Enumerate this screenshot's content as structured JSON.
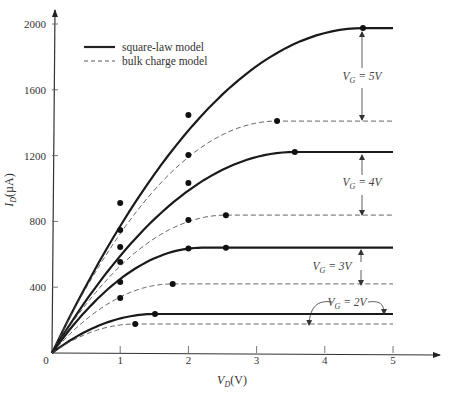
{
  "chart_data": {
    "type": "line",
    "title": "",
    "xlabel": "V_D(V)",
    "ylabel": "I_D(µA)",
    "xlim": [
      0,
      5.5
    ],
    "ylim": [
      0,
      2100
    ],
    "x_ticks": [
      "0",
      "1",
      "2",
      "3",
      "4",
      "5"
    ],
    "y_ticks": [
      "400",
      "800",
      "1200",
      "1600",
      "2000"
    ],
    "origin_label": "0",
    "grid": false,
    "legend": {
      "position": "upper-left",
      "entries": [
        {
          "label": "square-law model",
          "style": "solid"
        },
        {
          "label": "bulk charge model",
          "style": "dashed"
        }
      ]
    },
    "annotations": [
      {
        "text": "V_G = 5V",
        "sub": "G",
        "main": "V",
        "rest": " = 5V"
      },
      {
        "text": "V_G = 4V",
        "sub": "G",
        "main": "V",
        "rest": " = 4V"
      },
      {
        "text": "V_G = 3V",
        "sub": "G",
        "main": "V",
        "rest": " = 3V"
      },
      {
        "text": "V_G = 2V",
        "sub": "G",
        "main": "V",
        "rest": " = 2V"
      }
    ],
    "series": [
      {
        "name": "square-law model, V_G=5V",
        "style": "solid",
        "vdsat": 4.56,
        "isat": 1975,
        "markers": [
          [
            1,
            912
          ],
          [
            2,
            1447
          ],
          [
            4.56,
            1975
          ]
        ]
      },
      {
        "name": "bulk charge model, V_G=5V",
        "style": "dashed",
        "vdsat": 3.3,
        "isat": 1410,
        "markers": [
          [
            1,
            748
          ],
          [
            2,
            1204
          ],
          [
            3.3,
            1410
          ]
        ]
      },
      {
        "name": "square-law model, V_G=4V",
        "style": "solid",
        "vdsat": 3.56,
        "isat": 1222,
        "markers": [
          [
            1,
            645
          ],
          [
            2,
            1034
          ],
          [
            3.56,
            1222
          ]
        ]
      },
      {
        "name": "bulk charge model, V_G=4V",
        "style": "dashed",
        "vdsat": 2.55,
        "isat": 838,
        "markers": [
          [
            1,
            553
          ],
          [
            2,
            808
          ],
          [
            2.55,
            838
          ]
        ]
      },
      {
        "name": "square-law model, V_G=3V",
        "style": "solid",
        "vdsat": 2.2,
        "isat": 640,
        "markers": [
          [
            1,
            432
          ],
          [
            2,
            636
          ],
          [
            2.55,
            640
          ]
        ]
      },
      {
        "name": "bulk charge model, V_G=3V",
        "style": "dashed",
        "vdsat": 1.77,
        "isat": 420,
        "markers": [
          [
            1,
            334
          ],
          [
            1.77,
            420
          ]
        ]
      },
      {
        "name": "square-law model, V_G=2V",
        "style": "solid",
        "vdsat": 1.51,
        "isat": 237,
        "markers": [
          [
            1.51,
            237
          ]
        ]
      },
      {
        "name": "bulk charge model, V_G=2V",
        "style": "dashed",
        "vdsat": 1.22,
        "isat": 176,
        "markers": [
          [
            1.22,
            176
          ]
        ]
      }
    ]
  }
}
